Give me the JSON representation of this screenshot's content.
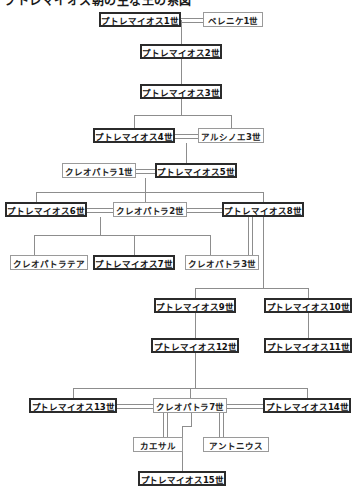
{
  "title": "プトレマイオス朝の主な王の系図",
  "nodes": [
    {
      "id": "ptolemy1",
      "label": "プトレマイオス1世",
      "type": "ruler",
      "x": 99,
      "y": 12,
      "w": 82,
      "h": 15
    },
    {
      "id": "berenike1",
      "label": "ベレニケ1世",
      "type": "consort",
      "x": 203,
      "y": 12,
      "w": 60,
      "h": 15
    },
    {
      "id": "ptolemy2",
      "label": "プトレマイオス2世",
      "type": "ruler",
      "x": 140,
      "y": 44,
      "w": 82,
      "h": 15
    },
    {
      "id": "ptolemy3",
      "label": "プトレマイオス3世",
      "type": "ruler",
      "x": 140,
      "y": 84,
      "w": 82,
      "h": 15
    },
    {
      "id": "ptolemy4",
      "label": "プトレマイオス4世",
      "type": "ruler",
      "x": 93,
      "y": 128,
      "w": 82,
      "h": 15
    },
    {
      "id": "arsinoe3",
      "label": "アルシノエ3世",
      "type": "consort",
      "x": 198,
      "y": 128,
      "w": 66,
      "h": 15
    },
    {
      "id": "cleopatra1",
      "label": "クレオパトラ1世",
      "type": "consort",
      "x": 62,
      "y": 163,
      "w": 74,
      "h": 15
    },
    {
      "id": "ptolemy5",
      "label": "プトレマイオス5世",
      "type": "ruler",
      "x": 155,
      "y": 163,
      "w": 82,
      "h": 15
    },
    {
      "id": "ptolemy6",
      "label": "プトレマイオス6世",
      "type": "ruler",
      "x": 5,
      "y": 202,
      "w": 82,
      "h": 15
    },
    {
      "id": "cleopatra2",
      "label": "クレオパトラ2世",
      "type": "consort",
      "x": 113,
      "y": 202,
      "w": 74,
      "h": 15
    },
    {
      "id": "ptolemy8",
      "label": "プトレマイオス8世",
      "type": "ruler",
      "x": 222,
      "y": 202,
      "w": 82,
      "h": 15
    },
    {
      "id": "cleothea",
      "label": "クレオパトラテア",
      "type": "consort",
      "x": 10,
      "y": 255,
      "w": 78,
      "h": 15
    },
    {
      "id": "ptolemy7",
      "label": "プトレマイオス7世",
      "type": "ruler",
      "x": 93,
      "y": 255,
      "w": 82,
      "h": 15
    },
    {
      "id": "cleopatra3",
      "label": "クレオパトラ3世",
      "type": "consort",
      "x": 185,
      "y": 255,
      "w": 74,
      "h": 15
    },
    {
      "id": "ptolemy9",
      "label": "プトレマイオス9世",
      "type": "ruler",
      "x": 154,
      "y": 298,
      "w": 82,
      "h": 15
    },
    {
      "id": "ptolemy10",
      "label": "プトレマイオス10世",
      "type": "ruler",
      "x": 264,
      "y": 298,
      "w": 88,
      "h": 15
    },
    {
      "id": "ptolemy12",
      "label": "プトレマイオス12世",
      "type": "ruler",
      "x": 151,
      "y": 338,
      "w": 88,
      "h": 15
    },
    {
      "id": "ptolemy11",
      "label": "プトレマイオス11世",
      "type": "ruler",
      "x": 264,
      "y": 338,
      "w": 88,
      "h": 15
    },
    {
      "id": "ptolemy13",
      "label": "プトレマイオス13世",
      "type": "ruler",
      "x": 29,
      "y": 398,
      "w": 88,
      "h": 15
    },
    {
      "id": "cleopatra7",
      "label": "クレオパトラ7世",
      "type": "consort",
      "x": 153,
      "y": 398,
      "w": 74,
      "h": 15
    },
    {
      "id": "ptolemy14",
      "label": "プトレマイオス14世",
      "type": "ruler",
      "x": 263,
      "y": 398,
      "w": 88,
      "h": 15
    },
    {
      "id": "caesar",
      "label": "カエサル",
      "type": "consort",
      "x": 133,
      "y": 437,
      "w": 50,
      "h": 15
    },
    {
      "id": "antonius",
      "label": "アントニウス",
      "type": "consort",
      "x": 203,
      "y": 437,
      "w": 66,
      "h": 15
    },
    {
      "id": "ptolemy15",
      "label": "プトレマイオス15世",
      "type": "ruler",
      "x": 138,
      "y": 471,
      "w": 88,
      "h": 15
    }
  ],
  "edges": [
    {
      "name": "marriage-ptolemy1-berenike1",
      "kind": "dbl-h",
      "x": 181,
      "y": 18,
      "len": 22
    },
    {
      "name": "descent-ptolemy1-ptolemy2",
      "kind": "v",
      "x": 181,
      "y": 20,
      "len": 24
    },
    {
      "name": "descent-ptolemy2-ptolemy3",
      "kind": "v",
      "x": 181,
      "y": 59,
      "len": 25
    },
    {
      "name": "descent-ptolemy3-stem",
      "kind": "v",
      "x": 181,
      "y": 99,
      "len": 16
    },
    {
      "name": "sibling-bar-gen4",
      "kind": "h",
      "x": 134,
      "y": 115,
      "len": 97
    },
    {
      "name": "drop-ptolemy4",
      "kind": "v",
      "x": 134,
      "y": 115,
      "len": 13
    },
    {
      "name": "drop-arsinoe3",
      "kind": "v",
      "x": 231,
      "y": 115,
      "len": 13
    },
    {
      "name": "marriage-ptolemy4-arsinoe3",
      "kind": "dbl-h",
      "x": 175,
      "y": 134,
      "len": 23
    },
    {
      "name": "descent-gen4-ptolemy5",
      "kind": "v",
      "x": 186,
      "y": 143,
      "len": 20
    },
    {
      "name": "marriage-cleopatra1-ptolemy5",
      "kind": "dbl-h",
      "x": 136,
      "y": 169,
      "len": 19
    },
    {
      "name": "descent-gen5-stem",
      "kind": "v",
      "x": 145,
      "y": 178,
      "len": 14
    },
    {
      "name": "sibling-bar-gen6",
      "kind": "h",
      "x": 36,
      "y": 192,
      "len": 227
    },
    {
      "name": "drop-ptolemy6",
      "kind": "v",
      "x": 36,
      "y": 192,
      "len": 10
    },
    {
      "name": "drop-cleopatra2",
      "kind": "v",
      "x": 145,
      "y": 192,
      "len": 10
    },
    {
      "name": "drop-ptolemy8",
      "kind": "v",
      "x": 263,
      "y": 192,
      "len": 10
    },
    {
      "name": "marriage-ptolemy6-cleopatra2",
      "kind": "dbl-h",
      "x": 87,
      "y": 208,
      "len": 26
    },
    {
      "name": "marriage-cleopatra2-ptolemy8",
      "kind": "dbl-h",
      "x": 187,
      "y": 208,
      "len": 35
    },
    {
      "name": "descent-gen6-stem",
      "kind": "v",
      "x": 100,
      "y": 217,
      "len": 18
    },
    {
      "name": "sibling-bar-gen7",
      "kind": "h",
      "x": 34,
      "y": 235,
      "len": 176
    },
    {
      "name": "drop-cleothea",
      "kind": "v",
      "x": 34,
      "y": 235,
      "len": 20
    },
    {
      "name": "drop-ptolemy7",
      "kind": "v",
      "x": 134,
      "y": 235,
      "len": 20
    },
    {
      "name": "drop-cleopatra3",
      "kind": "v",
      "x": 210,
      "y": 235,
      "len": 20
    },
    {
      "name": "marriage-ptolemy8-cleopatra3",
      "kind": "dbl-v",
      "x": 248,
      "y": 217,
      "len": 38
    },
    {
      "name": "descent-ptolemy8-stem",
      "kind": "v",
      "x": 263,
      "y": 217,
      "len": 18
    },
    {
      "name": "union-bar-gen8",
      "kind": "h",
      "x": 195,
      "y": 288,
      "len": 113
    },
    {
      "name": "stem-cleopatra3-down",
      "kind": "v",
      "x": 263,
      "y": 235,
      "len": 53
    },
    {
      "name": "drop-ptolemy9",
      "kind": "v",
      "x": 195,
      "y": 288,
      "len": 10
    },
    {
      "name": "drop-ptolemy10",
      "kind": "v",
      "x": 308,
      "y": 288,
      "len": 10
    },
    {
      "name": "descent-ptolemy9-ptolemy12",
      "kind": "v",
      "x": 195,
      "y": 313,
      "len": 25
    },
    {
      "name": "descent-ptolemy10-ptolemy11",
      "kind": "v",
      "x": 308,
      "y": 313,
      "len": 25
    },
    {
      "name": "descent-ptolemy12-stem",
      "kind": "v",
      "x": 195,
      "y": 353,
      "len": 35
    },
    {
      "name": "sibling-bar-gen10",
      "kind": "h",
      "x": 73,
      "y": 388,
      "len": 234
    },
    {
      "name": "drop-ptolemy13",
      "kind": "v",
      "x": 73,
      "y": 388,
      "len": 10
    },
    {
      "name": "drop-cleopatra7",
      "kind": "v",
      "x": 190,
      "y": 388,
      "len": 10
    },
    {
      "name": "drop-ptolemy14",
      "kind": "v",
      "x": 307,
      "y": 388,
      "len": 10
    },
    {
      "name": "marriage-ptolemy13-cleopatra7",
      "kind": "dbl-h",
      "x": 117,
      "y": 404,
      "len": 36
    },
    {
      "name": "marriage-cleopatra7-ptolemy14",
      "kind": "dbl-h",
      "x": 227,
      "y": 404,
      "len": 36
    },
    {
      "name": "marriage-cleopatra7-caesar",
      "kind": "dbl-v",
      "x": 163,
      "y": 413,
      "len": 24
    },
    {
      "name": "marriage-cleopatra7-antonius",
      "kind": "dbl-v",
      "x": 219,
      "y": 413,
      "len": 24
    },
    {
      "name": "descent-cleopatra7-branch",
      "kind": "v",
      "x": 191,
      "y": 413,
      "len": 13
    },
    {
      "name": "branch-bar-ptolemy15",
      "kind": "h",
      "x": 182,
      "y": 426,
      "len": 10
    },
    {
      "name": "descent-branch-ptolemy15",
      "kind": "v",
      "x": 182,
      "y": 426,
      "len": 45
    }
  ]
}
